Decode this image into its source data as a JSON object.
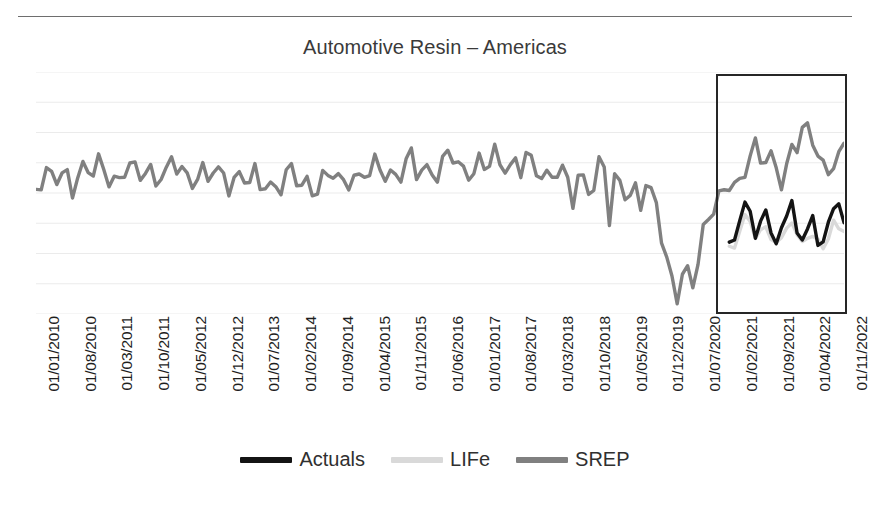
{
  "chart_data": {
    "type": "line",
    "title": "Automotive Resin – Americas",
    "xlabel": "",
    "ylabel": "",
    "grid": true,
    "grid_orientation": "horizontal",
    "gridline_count": 9,
    "legend_position": "bottom-center",
    "x_tick_labels": [
      "01/01/2010",
      "01/08/2010",
      "01/03/2011",
      "01/10/2011",
      "01/05/2012",
      "01/12/2012",
      "01/07/2013",
      "01/02/2014",
      "01/09/2014",
      "01/04/2015",
      "01/11/2015",
      "01/06/2016",
      "01/01/2017",
      "01/08/2017",
      "01/03/2018",
      "01/10/2018",
      "01/05/2019",
      "01/12/2019",
      "01/07/2020",
      "01/02/2021",
      "01/09/2021",
      "01/04/2022",
      "01/11/2022"
    ],
    "series": [
      {
        "name": "Actuals",
        "color": "#141414",
        "x": [
          133,
          134,
          135,
          136,
          137,
          138,
          139,
          140,
          141,
          142,
          143,
          144,
          145,
          146,
          147,
          148,
          149,
          150,
          151,
          152,
          153,
          154,
          155
        ],
        "values": [
          60,
          61,
          58,
          53,
          56,
          50,
          47,
          52,
          55,
          48,
          52,
          58,
          49,
          53,
          61,
          56,
          47,
          55,
          62,
          52,
          48,
          56,
          54
        ]
      },
      {
        "name": "LIFe",
        "color": "#d6d6d6",
        "x": [
          133,
          134,
          135,
          136,
          137,
          138,
          139,
          140,
          141,
          142,
          143,
          144,
          145,
          146,
          147,
          148,
          149,
          150,
          151,
          152,
          153,
          154,
          155
        ],
        "values": [
          55,
          53,
          50,
          46,
          49,
          44,
          41,
          45,
          48,
          42,
          46,
          50,
          43,
          47,
          52,
          49,
          42,
          48,
          54,
          47,
          44,
          50,
          49
        ]
      },
      {
        "name": "SREP",
        "color": "#808080",
        "x": [
          0,
          155
        ],
        "values": [
          40,
          70
        ]
      }
    ],
    "annotations": [
      {
        "type": "rectangle",
        "name": "forecast-highlight-box",
        "x_start_label": "01/02/2021",
        "x_end_label": "01/11/2022"
      }
    ]
  },
  "legend": {
    "items": [
      {
        "label": "Actuals",
        "color": "#141414",
        "swatch": "line-swatch"
      },
      {
        "label": "LIFe",
        "color": "#d9d9d9",
        "swatch": "line-swatch"
      },
      {
        "label": "SREP",
        "color": "#808080",
        "swatch": "line-swatch"
      }
    ]
  },
  "colors": {
    "actuals": "#141414",
    "life": "#d9d9d9",
    "srep": "#808080",
    "gridline": "#ebebeb",
    "box_border": "#262626",
    "title_text": "#3a3a3a",
    "tick_text": "#1e1e1e",
    "background": "#ffffff"
  }
}
